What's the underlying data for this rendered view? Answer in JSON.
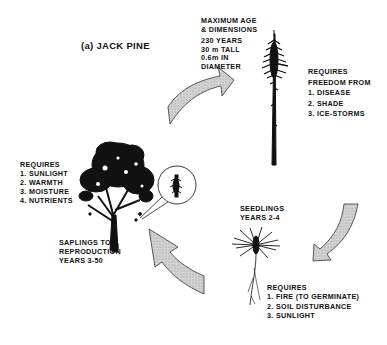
{
  "title": "(a) JACK PINE",
  "stages": {
    "mature": {
      "heading": [
        "MAXIMUM AGE",
        "& DIMENSIONS"
      ],
      "details": [
        "230 YEARS",
        "30 m TALL",
        "0.6m IN",
        "DIAMETER"
      ],
      "requires_heading": [
        "REQUIRES",
        "FREEDOM FROM"
      ],
      "requires": [
        "1. DISEASE",
        "2. SHADE",
        "3. ICE-STORMS"
      ]
    },
    "seedlings": {
      "label": [
        "SEEDLINGS",
        "YEARS 2-4"
      ],
      "requires_heading": "REQUIRES",
      "requires": [
        "1. FIRE (TO GERMINATE)",
        "2. SOIL DISTURBANCE",
        "3. SUNLIGHT"
      ]
    },
    "saplings": {
      "label": [
        "SAPLINGS TO",
        "REPRODUCTION",
        "YEARS 3-50"
      ],
      "requires_heading": "REQUIRES",
      "requires": [
        "1. SUNLIGHT",
        "2. WARMTH",
        "3. MOISTURE",
        "4. NUTRIENTS"
      ]
    }
  },
  "arrows": [
    {
      "name": "saplings-to-mature",
      "direction": "up-right"
    },
    {
      "name": "mature-to-seedlings",
      "direction": "down-left"
    },
    {
      "name": "seedlings-to-saplings",
      "direction": "up-left"
    }
  ],
  "colors": {
    "ink": "#111111",
    "arrow_fill": "#c8c8c8",
    "background": "#ffffff"
  }
}
